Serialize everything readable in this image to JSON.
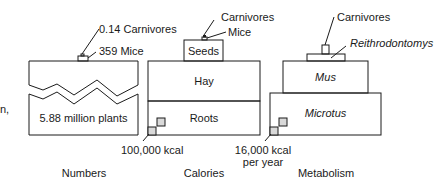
{
  "left_fragment": "n,",
  "pyramids": {
    "numbers": {
      "title": "Numbers",
      "top_label_1": "0.14 Carnivores",
      "top_label_2": "359 Mice",
      "base_label": "5.88 million plants"
    },
    "calories": {
      "title": "Calories",
      "top_label_1": "Carnivores",
      "top_label_2": "Mice",
      "level_3": "Seeds",
      "level_2": "Hay",
      "level_1": "Roots",
      "scale_label": "100,000 kcal"
    },
    "metabolism": {
      "title": "Metabolism",
      "top_label_1": "Carnivores",
      "level_3": "Reithrodontomys",
      "level_2": "Mus",
      "level_1": "Microtus",
      "scale_label_line1": "16,000 kcal",
      "scale_label_line2": "per year"
    }
  },
  "colors": {
    "stroke": "#1a1a1a",
    "scale_fill": "#d9d9d9",
    "background": "#ffffff"
  }
}
